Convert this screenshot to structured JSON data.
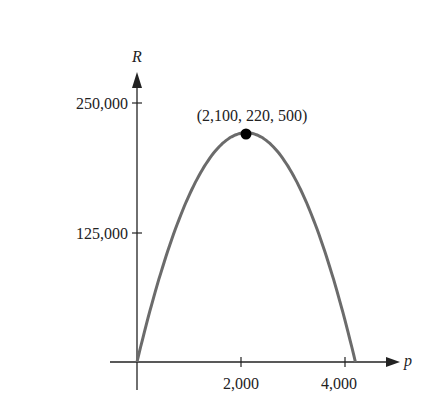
{
  "chart_data": {
    "type": "line",
    "title": "",
    "xlabel": "p",
    "ylabel": "R",
    "function": "R = p(8400 - 2p)/... (parabola through origin, vertex (2100, 220500), root at p=4200)",
    "x": [
      0,
      500,
      1000,
      1500,
      2000,
      2100,
      2500,
      3000,
      3500,
      4000,
      4200
    ],
    "y": [
      0,
      95000,
      168000,
      212000,
      220000,
      220500,
      216000,
      180000,
      123000,
      45000,
      0
    ],
    "xticks": [
      "2,000",
      "4,000"
    ],
    "xtick_values": [
      2000,
      4000
    ],
    "yticks": [
      "125,000",
      "250,000"
    ],
    "ytick_values": [
      125000,
      250000
    ],
    "xlim": [
      -500,
      5100
    ],
    "ylim": [
      0,
      275000
    ],
    "grid": false,
    "legend": null,
    "annotations": [
      {
        "point": [
          2100,
          220500
        ],
        "label": "(2,100, 220, 500)"
      }
    ],
    "colors": {
      "curve": "#6b6b6b",
      "axes": "#222222",
      "point": "#000000"
    }
  }
}
